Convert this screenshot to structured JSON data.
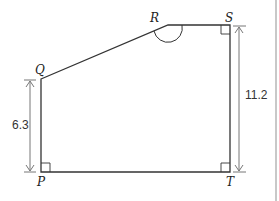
{
  "diagram": {
    "type": "pentagon-with-measurements",
    "vertices": {
      "P": {
        "label": "P",
        "x": 41,
        "y": 172
      },
      "Q": {
        "label": "Q",
        "x": 41,
        "y": 79
      },
      "R": {
        "label": "R",
        "x": 168,
        "y": 25
      },
      "S": {
        "label": "S",
        "x": 230,
        "y": 25
      },
      "T": {
        "label": "T",
        "x": 230,
        "y": 172
      }
    },
    "measurements": {
      "PQ": {
        "label": "6.3"
      },
      "ST": {
        "label": "11.2"
      }
    },
    "right_angles": [
      "P",
      "S",
      "T"
    ],
    "marked_angle": "R",
    "colors": {
      "shape_stroke": "#333333",
      "arrow_stroke": "#777777",
      "frame_line": "#bbbbbb"
    }
  }
}
